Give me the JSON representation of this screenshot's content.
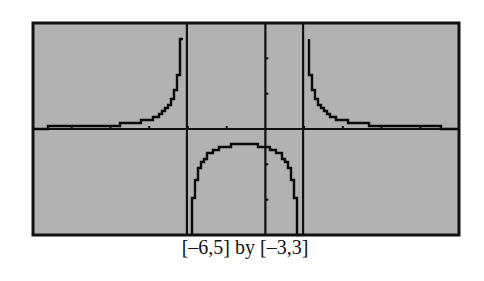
{
  "chart_data": {
    "type": "line",
    "title": "",
    "caption": "[–6,5] by [–3,3]",
    "function": "y = 1/((x+2)(x-1))",
    "xlabel": "",
    "ylabel": "",
    "xlim": [
      -6,
      5
    ],
    "ylim": [
      -3,
      3
    ],
    "xscl": 1,
    "yscl": 1,
    "grid": false,
    "legend": null,
    "vertical_asymptotes": [
      -2,
      1
    ],
    "horizontal_asymptote": 0,
    "local_max": {
      "x": -0.5,
      "y": -0.444
    },
    "series": [
      {
        "name": "left branch (x < -2)",
        "x": [
          -6,
          -5,
          -4,
          -3,
          -2.5,
          -2.2,
          -2.1
        ],
        "y": [
          0.036,
          0.056,
          0.1,
          0.25,
          0.571,
          1.563,
          3.226
        ]
      },
      {
        "name": "middle branch (-2 < x < 1)",
        "x": [
          -1.9,
          -1.5,
          -1,
          -0.5,
          0,
          0.5,
          0.9
        ],
        "y": [
          -3.448,
          -0.8,
          -0.5,
          -0.444,
          -0.5,
          -0.8,
          -3.448
        ]
      },
      {
        "name": "right branch (x > 1)",
        "x": [
          1.1,
          1.2,
          1.5,
          2,
          3,
          4,
          5
        ],
        "y": [
          3.226,
          1.563,
          0.571,
          0.25,
          0.1,
          0.056,
          0.036
        ]
      }
    ]
  },
  "screen": {
    "background": "#b2b2b2",
    "frame_color": "#111111",
    "curve_color": "#0a0a0a",
    "axis_color": "#111111",
    "asymptote_color": "#111111",
    "plot_box": {
      "left": 33,
      "top": 23,
      "right": 459,
      "bottom": 235
    }
  },
  "caption": {
    "text": "[–6,5] by [–3,3]"
  }
}
